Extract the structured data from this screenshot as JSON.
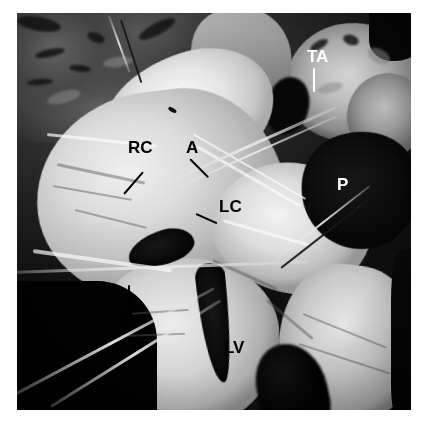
{
  "figure": {
    "type": "anatomical-dissection-photograph",
    "color_mode": "grayscale",
    "border_color": "#ffffff",
    "photo": {
      "left": 17,
      "top": 13,
      "width": 394,
      "height": 397
    }
  },
  "labels": [
    {
      "id": "rc",
      "text": "RC",
      "color": "#000000",
      "x": 128,
      "y": 139,
      "font_size": 17,
      "leader": {
        "from_x": 126,
        "from_y": 158,
        "to_x": 107,
        "to_y": 180,
        "color": "#000000"
      },
      "meaning": "right coronary cusp"
    },
    {
      "id": "a",
      "text": "A",
      "color": "#000000",
      "x": 186,
      "y": 139,
      "font_size": 17,
      "leader": {
        "from_x": 190,
        "from_y": 158,
        "to_x": 208,
        "to_y": 176,
        "color": "#000000"
      },
      "meaning": "aorta"
    },
    {
      "id": "lc",
      "text": "LC",
      "color": "#000000",
      "x": 219,
      "y": 198,
      "font_size": 17,
      "leader": {
        "from_x": 216,
        "from_y": 204,
        "to_x": 196,
        "to_y": 213,
        "color": "#000000"
      },
      "meaning": "left coronary cusp"
    },
    {
      "id": "ta",
      "text": "TA",
      "color": "#ffffff",
      "x": 307,
      "y": 48,
      "font_size": 17,
      "leader": {
        "from_x": 313,
        "from_y": 66,
        "to_x": 313,
        "to_y": 92,
        "color": "#ffffff"
      },
      "meaning": "transverse aorta"
    },
    {
      "id": "p-right",
      "text": "P",
      "color": "#ffffff",
      "x": 337,
      "y": 176,
      "font_size": 17,
      "leader": null,
      "meaning": "pulmonary trunk"
    },
    {
      "id": "p-lower",
      "text": "P",
      "color": "#000000",
      "x": 122,
      "y": 309,
      "font_size": 17,
      "leader": {
        "from_x": 127,
        "from_y": 285,
        "to_x": 127,
        "to_y": 307,
        "color": "#000000"
      },
      "meaning": "pulmonary valve"
    },
    {
      "id": "lv",
      "text": "LV",
      "color": "#000000",
      "x": 224,
      "y": 339,
      "font_size": 17,
      "leader": null,
      "meaning": "left ventricle"
    }
  ],
  "markers": [
    {
      "id": "arrowhead-upper",
      "kind": "arrowhead",
      "x": 155,
      "y": 98,
      "color": "#101010"
    }
  ]
}
